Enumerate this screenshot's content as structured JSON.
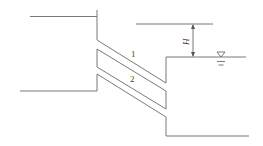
{
  "diagram": {
    "type": "hydraulics-pipe-between-reservoirs",
    "labels": {
      "pipe_upper": "1",
      "pipe_lower": "2",
      "head": "H"
    },
    "symbols": {
      "water_level": "water-level-triangle-icon"
    },
    "colors": {
      "line": "#6a6a6a",
      "text": "#444444",
      "background": "#ffffff"
    }
  }
}
